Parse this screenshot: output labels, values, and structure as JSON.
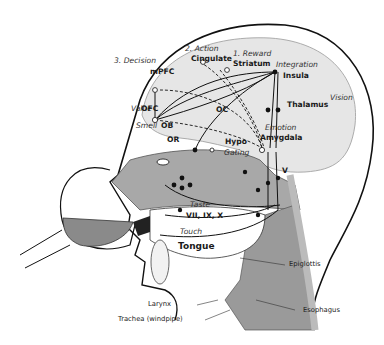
{
  "labels": {
    "decision": "3. Decision",
    "mpfc": "mPFC",
    "action": "2. Action",
    "cingulate": "Cingulate",
    "reward": "1. Reward",
    "striatum": "Striatum",
    "integration": "Integration",
    "insula": "Insula",
    "value": "Value",
    "ofc": "OFC",
    "oc": "OC",
    "thalamus": "Thalamus",
    "vision": "Vision",
    "smell": "Smell",
    "ob": "OB",
    "or": "OR",
    "emotion": "Emotion",
    "hypo": "Hypo",
    "amygdala": "Amygdala",
    "gating": "Gating",
    "v": "V",
    "taste": "Taste",
    "cranial_nerves": "VII, IX, X",
    "touch": "Touch",
    "tongue": "Tongue",
    "epiglottis": "Epiglottis",
    "larynx": "Larynx",
    "trachea": "Trachea (windpipe)",
    "esophagus": "Esophagus"
  },
  "colors": {
    "brain": "#e6e6e6",
    "nasal": "#a8a8a8",
    "throat": "#9a9a9a",
    "line": "#111111"
  }
}
